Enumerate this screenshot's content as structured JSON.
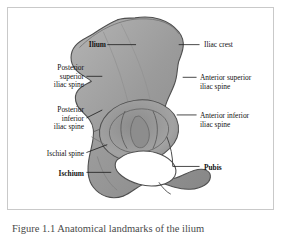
{
  "figure": {
    "caption": "Figure 1.1 Anatomical landmarks of the ilium",
    "frame_border_color": "#c9c9c9",
    "background_color": "#ffffff"
  },
  "colors": {
    "bone_fill": "#9a9a9a",
    "bone_fill_light": "#b0b0b0",
    "bone_fill_dark": "#7e7e7e",
    "bone_outline": "#4f4f4f",
    "leader_line": "#1a1a1a",
    "label_text": "#111111",
    "caption_text": "#4a4a4a",
    "foramen_fill": "#ffffff"
  },
  "labels": {
    "left": [
      {
        "id": "ilium",
        "text": "Ilium",
        "bold": true,
        "align": "right",
        "x": 46,
        "y": 33,
        "width": 52,
        "leader": {
          "x1": 100,
          "y1": 37,
          "x2": 129,
          "y2": 37
        }
      },
      {
        "id": "posterior-superior-iliac-spine",
        "text": "Posterior\nsuperior\niliac spine",
        "bold": false,
        "align": "right",
        "x": 14,
        "y": 56,
        "width": 62,
        "leader": {
          "x1": 79,
          "y1": 69,
          "x2": 95,
          "y2": 69
        }
      },
      {
        "id": "posterior-inferior-iliac-spine",
        "text": "Posterior\ninferior\niliac spine",
        "bold": false,
        "align": "right",
        "x": 14,
        "y": 98,
        "width": 62,
        "leader": {
          "x1": 79,
          "y1": 111,
          "x2": 95,
          "y2": 103
        }
      },
      {
        "id": "ischial-spine",
        "text": "Ischial spine",
        "bold": false,
        "align": "right",
        "x": 14,
        "y": 142,
        "width": 62,
        "leader": {
          "x1": 79,
          "y1": 146,
          "x2": 100,
          "y2": 138
        }
      },
      {
        "id": "ischium",
        "text": "Ischium",
        "bold": true,
        "align": "right",
        "x": 22,
        "y": 162,
        "width": 54,
        "leader": {
          "x1": 79,
          "y1": 166,
          "x2": 104,
          "y2": 166
        }
      }
    ],
    "right": [
      {
        "id": "iliac-crest",
        "text": "Iliac crest",
        "bold": false,
        "align": "left",
        "x": 196,
        "y": 33,
        "width": 80,
        "leader": {
          "x1": 172,
          "y1": 37,
          "x2": 193,
          "y2": 37
        }
      },
      {
        "id": "anterior-superior-iliac-spine",
        "text": "Anterior superior\niliac spine",
        "bold": false,
        "align": "left",
        "x": 192,
        "y": 66,
        "width": 86,
        "leader": {
          "x1": 176,
          "y1": 70,
          "x2": 190,
          "y2": 70
        }
      },
      {
        "id": "anterior-inferior-iliac-spine",
        "text": "Anterior inferior\niliac spine",
        "bold": false,
        "align": "left",
        "x": 192,
        "y": 104,
        "width": 86,
        "leader": {
          "x1": 170,
          "y1": 108,
          "x2": 190,
          "y2": 108
        }
      },
      {
        "id": "pubis",
        "text": "Pubis",
        "bold": true,
        "align": "left",
        "x": 196,
        "y": 156,
        "width": 70,
        "leader": {
          "x1": 166,
          "y1": 160,
          "x2": 193,
          "y2": 160
        }
      }
    ]
  },
  "structures": [
    {
      "id": "iliac-blade",
      "name": "ilium blade"
    },
    {
      "id": "acetabulum",
      "name": "acetabulum"
    },
    {
      "id": "obturator-foramen",
      "name": "obturator foramen"
    },
    {
      "id": "ischial-body",
      "name": "ischium"
    },
    {
      "id": "pubic-ramus",
      "name": "pubis"
    }
  ]
}
